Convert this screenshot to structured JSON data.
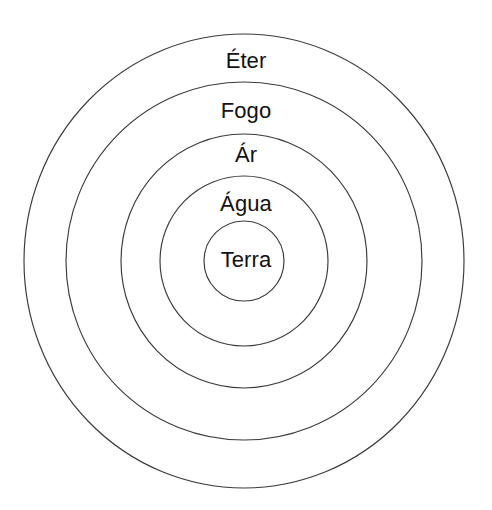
{
  "diagram": {
    "background_color": "#ffffff",
    "stroke_color": "#3a3a3a",
    "text_color": "#111111",
    "center": {
      "x": 244,
      "y": 261
    },
    "rings": [
      {
        "id": "eter",
        "label": "Éter",
        "order": 1,
        "rx": 220,
        "ry": 227,
        "label_x": 244,
        "label_y": 62,
        "font_size": 22
      },
      {
        "id": "fogo",
        "label": "Fogo",
        "order": 2,
        "rx": 178,
        "ry": 179,
        "label_x": 244,
        "label_y": 112,
        "font_size": 22
      },
      {
        "id": "ar",
        "label": "Ár",
        "order": 3,
        "rx": 123,
        "ry": 127,
        "label_x": 244,
        "label_y": 156,
        "font_size": 22
      },
      {
        "id": "agua",
        "label": "Água",
        "order": 4,
        "rx": 84,
        "ry": 85,
        "label_x": 244,
        "label_y": 205,
        "font_size": 22
      },
      {
        "id": "terra",
        "label": "Terra",
        "order": 5,
        "rx": 40,
        "ry": 40,
        "label_x": 244,
        "label_y": 261,
        "font_size": 22
      }
    ]
  },
  "chart_data": {
    "type": "pie",
    "categories": [
      "Éter",
      "Fogo",
      "Ár",
      "Água",
      "Terra"
    ],
    "values": [
      220,
      178,
      123,
      84,
      40
    ],
    "xlabel": "",
    "ylabel": "Raio (px)",
    "legend": "none",
    "grid": false
  }
}
